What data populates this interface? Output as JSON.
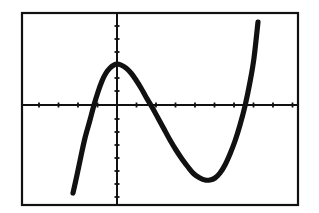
{
  "figure": {
    "title": "Graph of a cubic function",
    "background_color": "#ffffff",
    "ink_color": "#111111",
    "frame": {
      "label": "viewing-window-border",
      "x": 22,
      "y": 13,
      "width": 276,
      "height": 192,
      "stroke_width": 2.2
    },
    "axes": {
      "x_axis_label": "x-axis",
      "y_axis_label": "y-axis",
      "origin_px": {
        "x": 117,
        "y": 105
      },
      "x_axis_y_px": 105,
      "y_axis_x_px": 117,
      "axis_stroke_width": 2.0,
      "tick_length_px": 5,
      "tick_stroke_width": 1.8,
      "tick_spacing_px": 19.5,
      "x_ticks_px": [
        39,
        58.5,
        78,
        97.5,
        136.5,
        156,
        175.5,
        195,
        214.5,
        234,
        253.5,
        273,
        292.5
      ],
      "y_ticks_px": [
        26,
        39,
        52,
        65,
        78,
        91,
        119,
        132,
        145,
        158,
        171,
        184,
        197
      ]
    },
    "curve": {
      "label": "cubic-curve",
      "stroke_width": 5.2,
      "stroke_color": "#111111",
      "points_px": [
        [
          73,
          193
        ],
        [
          77,
          175
        ],
        [
          81,
          156
        ],
        [
          85,
          138
        ],
        [
          90,
          120
        ],
        [
          94,
          105
        ],
        [
          98,
          92
        ],
        [
          102,
          81
        ],
        [
          106,
          73
        ],
        [
          110,
          68
        ],
        [
          114,
          65
        ],
        [
          117,
          64
        ],
        [
          121,
          65
        ],
        [
          126,
          68
        ],
        [
          131,
          73
        ],
        [
          136,
          80
        ],
        [
          141,
          88
        ],
        [
          146,
          97
        ],
        [
          152,
          107
        ],
        [
          158,
          118
        ],
        [
          164,
          129
        ],
        [
          170,
          140
        ],
        [
          176,
          150
        ],
        [
          182,
          159
        ],
        [
          188,
          167
        ],
        [
          194,
          174
        ],
        [
          200,
          178
        ],
        [
          205,
          180
        ],
        [
          210,
          180
        ],
        [
          215,
          178
        ],
        [
          220,
          173
        ],
        [
          225,
          165
        ],
        [
          230,
          154
        ],
        [
          235,
          141
        ],
        [
          240,
          125
        ],
        [
          245,
          106
        ],
        [
          250,
          82
        ],
        [
          254,
          58
        ],
        [
          258,
          22
        ]
      ]
    }
  },
  "chart_data": {
    "type": "line",
    "title": "Graph of a cubic function",
    "xlabel": "x",
    "ylabel": "y",
    "grid": false,
    "legend": null,
    "xlim": [
      -4.9,
      9.3
    ],
    "ylim": [
      -5.1,
      4.7
    ],
    "x_tick_interval": 1,
    "y_tick_interval": 1,
    "axis_lines": {
      "x_at_y": 0,
      "y_at_x": 0
    },
    "features": {
      "local_maximum": {
        "x": 0.0,
        "y": 2.1
      },
      "local_minimum": {
        "x": 4.5,
        "y": -3.9
      },
      "x_intercepts": [
        -1.4,
        1.8,
        6.3
      ],
      "y_intercept": 2.1,
      "end_behavior_left": "falls",
      "end_behavior_right": "rises"
    },
    "series": [
      {
        "name": "f(x)",
        "x": [
          -2.25,
          -2.05,
          -1.85,
          -1.64,
          -1.38,
          -1.18,
          -0.97,
          -0.77,
          -0.56,
          -0.36,
          -0.15,
          0.0,
          0.2,
          0.46,
          0.72,
          0.97,
          1.23,
          1.49,
          1.79,
          2.1,
          2.41,
          2.72,
          3.03,
          3.33,
          3.64,
          3.95,
          4.26,
          4.51,
          4.77,
          5.03,
          5.28,
          5.54,
          5.79,
          6.05,
          6.31,
          6.56,
          6.82,
          7.03,
          7.23
        ],
        "y": [
          -4.51,
          -3.59,
          -2.62,
          -1.69,
          -0.77,
          0.0,
          0.67,
          1.23,
          1.64,
          1.9,
          2.05,
          2.1,
          2.05,
          1.9,
          1.69,
          1.33,
          0.92,
          0.46,
          -0.1,
          -0.67,
          -1.23,
          -1.79,
          -2.31,
          -2.77,
          -3.18,
          -3.54,
          -3.74,
          -3.85,
          -3.85,
          -3.74,
          -3.49,
          -3.08,
          -2.51,
          -1.85,
          -1.03,
          0.0,
          1.23,
          2.46,
          4.26
        ]
      }
    ]
  }
}
